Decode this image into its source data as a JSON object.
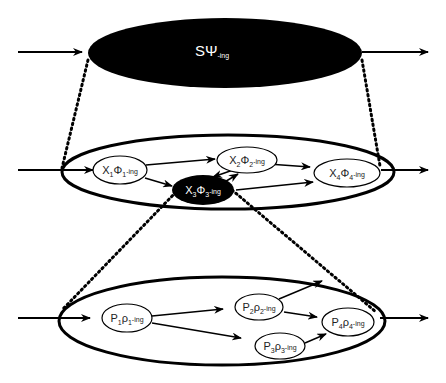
{
  "colors": {
    "ink": "#000000",
    "paper": "#ffffff",
    "dark_node_text": "#ffffff"
  },
  "levels": [
    {
      "id": "system",
      "label": {
        "main": "SΨ",
        "suffix": "-ing"
      },
      "style": "filled-black"
    },
    {
      "id": "component-level",
      "nodes": [
        {
          "id": "X1",
          "base": "X",
          "sub1": "1",
          "greek": "Φ",
          "sub2": "1",
          "suffix": "-ing",
          "style": "outline"
        },
        {
          "id": "X2",
          "base": "X",
          "sub1": "2",
          "greek": "Φ",
          "sub2": "2",
          "suffix": "-ing",
          "style": "outline"
        },
        {
          "id": "X3",
          "base": "X",
          "sub1": "3",
          "greek": "Φ",
          "sub2": "3",
          "suffix": "-ing",
          "style": "filled-black"
        },
        {
          "id": "X4",
          "base": "X",
          "sub1": "4",
          "greek": "Φ",
          "sub2": "4",
          "suffix": "-ing",
          "style": "outline"
        }
      ],
      "edges": [
        [
          "in",
          "X1"
        ],
        [
          "X1",
          "X2"
        ],
        [
          "X1",
          "X3"
        ],
        [
          "X2",
          "X3"
        ],
        [
          "X3",
          "X2"
        ],
        [
          "X2",
          "X4"
        ],
        [
          "X3",
          "X4"
        ],
        [
          "X4",
          "out"
        ]
      ]
    },
    {
      "id": "subcomponent-level",
      "nodes": [
        {
          "id": "P1",
          "base": "P",
          "sub1": "1",
          "greek": "ρ",
          "sub2": "1",
          "suffix": "-ing",
          "style": "outline"
        },
        {
          "id": "P2",
          "base": "P",
          "sub1": "2",
          "greek": "ρ",
          "sub2": "2",
          "suffix": "-ing",
          "style": "outline"
        },
        {
          "id": "P3",
          "base": "P",
          "sub1": "3",
          "greek": "ρ",
          "sub2": "3",
          "suffix": "-ing",
          "style": "outline"
        },
        {
          "id": "P4",
          "base": "P",
          "sub1": "4",
          "greek": "ρ",
          "sub2": "4",
          "suffix": "-ing",
          "style": "outline"
        }
      ],
      "edges": [
        [
          "in",
          "P1"
        ],
        [
          "P1",
          "P2"
        ],
        [
          "P1",
          "P3"
        ],
        [
          "P2",
          "P4"
        ],
        [
          "P2",
          "out-up"
        ],
        [
          "P3",
          "P4"
        ],
        [
          "P4",
          "out"
        ]
      ]
    }
  ],
  "zoom_links": [
    {
      "from": "system",
      "to": "component-level",
      "style": "dotted"
    },
    {
      "from": "X3",
      "to": "subcomponent-level",
      "style": "dotted"
    }
  ]
}
